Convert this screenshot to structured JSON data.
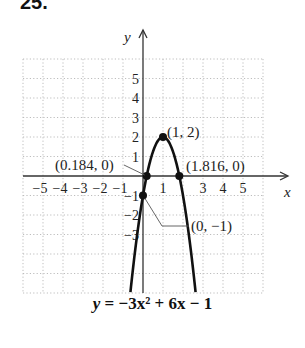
{
  "problem": {
    "number": "25."
  },
  "axes": {
    "x_label": "x",
    "y_label": "y"
  },
  "equation": {
    "lhs": "y",
    "eq": " = ",
    "rhs": "−3x² + 6x − 1"
  },
  "chart_data": {
    "type": "line",
    "xlabel": "x",
    "ylabel": "y",
    "xlim": [
      -6,
      6
    ],
    "ylim": [
      -6,
      6
    ],
    "grid": true,
    "x_tick_labels": [
      "-5",
      "-4",
      "-3",
      "-2",
      "-1",
      "1",
      "3",
      "4",
      "5"
    ],
    "y_tick_labels": [
      "5",
      "4",
      "3",
      "2",
      "1",
      "-1",
      "-2",
      "-3"
    ],
    "series": [
      {
        "name": "y = -3x^2 + 6x - 1",
        "function": "-3*x^2 + 6*x - 1",
        "x": [
          -0.6,
          -0.4,
          -0.2,
          0,
          0.184,
          0.4,
          0.6,
          0.8,
          1,
          1.2,
          1.4,
          1.6,
          1.816,
          2,
          2.2,
          2.4,
          2.6
        ],
        "y": [
          -5.68,
          -3.88,
          -2.32,
          -1,
          0,
          0.92,
          1.52,
          1.88,
          2,
          1.88,
          1.52,
          0.92,
          0,
          -1,
          -2.32,
          -3.88,
          -5.68
        ]
      }
    ],
    "annotations": [
      {
        "label": "(1, 2)",
        "x": 1,
        "y": 2
      },
      {
        "label": "(0.184, 0)",
        "x": 0.184,
        "y": 0
      },
      {
        "label": "(1.816, 0)",
        "x": 1.816,
        "y": 0
      },
      {
        "label": "(0, −1)",
        "x": 0,
        "y": -1
      }
    ]
  }
}
